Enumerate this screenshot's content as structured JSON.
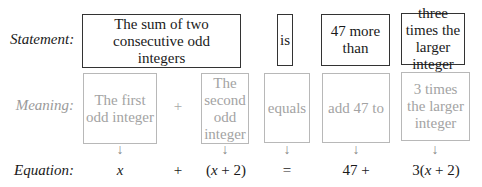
{
  "labels": {
    "statement": "Statement:",
    "meaning": "Meaning:",
    "equation": "Equation:"
  },
  "statement": {
    "part1": "The sum of two consecutive odd integers",
    "part2": "is",
    "part3": "47 more than",
    "part4": "three times the larger integer"
  },
  "meaning": {
    "part1": "The first odd integer",
    "op1": "+",
    "part2": "The second odd integer",
    "part3": "equals",
    "part4": "add 47 to",
    "part5": "3 times the larger integer"
  },
  "arrow": "↓",
  "equation": {
    "term1_var": "x",
    "op1": "+",
    "term2": "(x + 2)",
    "eq": "=",
    "term3": "47 +",
    "term4": "3(x + 2)"
  }
}
